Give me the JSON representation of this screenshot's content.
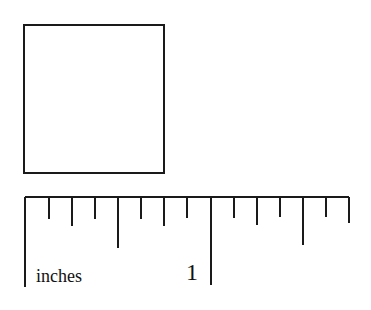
{
  "figure": {
    "square": {
      "x": 24,
      "y": 25,
      "size": 140,
      "stroke": "#1a1a1a"
    },
    "ruler": {
      "unit_label": "inches",
      "inch_label": "1",
      "baseline_y": 197,
      "x_start": 25,
      "x_end": 349,
      "pixels_per_inch": 186,
      "subdivisions_per_inch": 8,
      "ticks": [
        {
          "x": 25,
          "bottom": 287
        },
        {
          "x": 49,
          "bottom": 219
        },
        {
          "x": 72,
          "bottom": 226
        },
        {
          "x": 95,
          "bottom": 219
        },
        {
          "x": 118,
          "bottom": 248
        },
        {
          "x": 141,
          "bottom": 219
        },
        {
          "x": 164,
          "bottom": 226
        },
        {
          "x": 187,
          "bottom": 218
        },
        {
          "x": 211,
          "bottom": 285
        },
        {
          "x": 234,
          "bottom": 218
        },
        {
          "x": 257,
          "bottom": 225
        },
        {
          "x": 280,
          "bottom": 217
        },
        {
          "x": 303,
          "bottom": 245
        },
        {
          "x": 326,
          "bottom": 217
        },
        {
          "x": 349,
          "bottom": 223
        }
      ]
    }
  }
}
